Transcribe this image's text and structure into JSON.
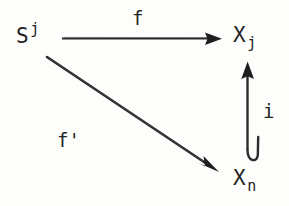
{
  "diagram": {
    "kind": "commutative-diagram",
    "background_color": "#fdfdfc",
    "ink_color": "#242424",
    "nodes": [
      {
        "id": "sj",
        "base": "S",
        "script": "j",
        "script_type": "superscript",
        "full_text": "S^j",
        "position": "top-left"
      },
      {
        "id": "xj",
        "base": "X",
        "script": "j",
        "script_type": "subscript",
        "full_text": "X_j",
        "position": "top-right"
      },
      {
        "id": "xn",
        "base": "X",
        "script": "n",
        "script_type": "subscript",
        "full_text": "X_n",
        "position": "bottom-right"
      }
    ],
    "arrows": [
      {
        "id": "arrow-f",
        "label": "f",
        "from": "sj",
        "to": "xj",
        "style": "solid",
        "head": "filled-triangle",
        "tail": "plain",
        "orientation": "horizontal",
        "label_position": "above"
      },
      {
        "id": "arrow-f-prime",
        "label": "f'",
        "from": "sj",
        "to": "xn",
        "style": "solid",
        "head": "filled-triangle",
        "tail": "plain",
        "orientation": "diagonal",
        "label_position": "below-left"
      },
      {
        "id": "arrow-i",
        "label": "i",
        "from": "xn",
        "to": "xj",
        "style": "solid",
        "head": "filled-triangle",
        "tail": "hook",
        "orientation": "vertical-up",
        "label_position": "right"
      }
    ]
  }
}
